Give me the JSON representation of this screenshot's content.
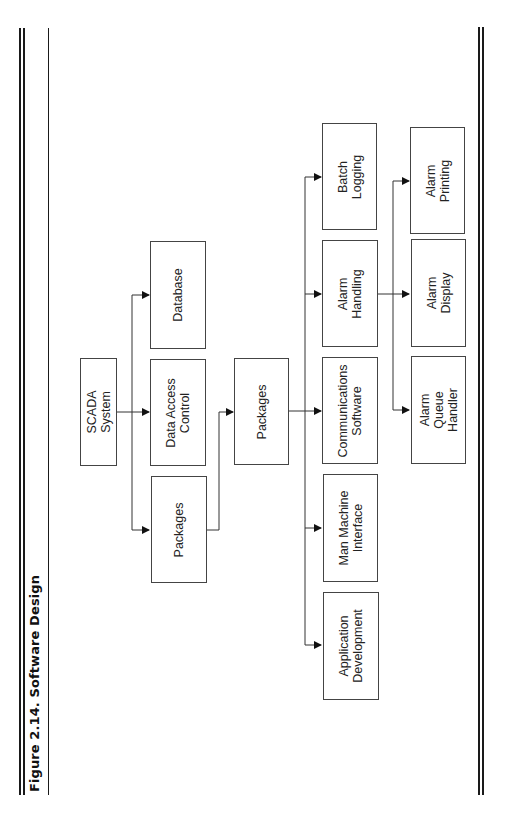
{
  "figure": {
    "title": "Figure 2.14. Software Design",
    "orientation": "rotated-90-ccw"
  },
  "diagram": {
    "type": "hierarchy",
    "nodes": {
      "scada_system": {
        "label": "SCADA\nSystem",
        "level": 1
      },
      "database": {
        "label": "Database",
        "level": 2
      },
      "data_access_control": {
        "label": "Data Access\nControl",
        "level": 2
      },
      "packages_l2": {
        "label": "Packages",
        "level": 2
      },
      "packages_l3": {
        "label": "Packages",
        "level": 3
      },
      "batch_logging": {
        "label": "Batch\nLogging",
        "level": 4
      },
      "alarm_handling": {
        "label": "Alarm\nHandling",
        "level": 4
      },
      "communications_software": {
        "label": "Communications\nSoftware",
        "level": 4
      },
      "man_machine_interface": {
        "label": "Man Machine\nInterface",
        "level": 4
      },
      "application_development": {
        "label": "Application\nDevelopment",
        "level": 4
      },
      "alarm_printing": {
        "label": "Alarm\nPrinting",
        "level": 5
      },
      "alarm_display": {
        "label": "Alarm\nDisplay",
        "level": 5
      },
      "alarm_queue_handler": {
        "label": "Alarm\nQueue\nHandler",
        "level": 5
      }
    },
    "edges": [
      {
        "from": "scada_system",
        "to": "database"
      },
      {
        "from": "scada_system",
        "to": "data_access_control"
      },
      {
        "from": "scada_system",
        "to": "packages_l2"
      },
      {
        "from": "packages_l2",
        "to": "packages_l3"
      },
      {
        "from": "packages_l3",
        "to": "batch_logging"
      },
      {
        "from": "packages_l3",
        "to": "alarm_handling"
      },
      {
        "from": "packages_l3",
        "to": "communications_software"
      },
      {
        "from": "packages_l3",
        "to": "man_machine_interface"
      },
      {
        "from": "packages_l3",
        "to": "application_development"
      },
      {
        "from": "alarm_handling",
        "to": "alarm_printing"
      },
      {
        "from": "alarm_handling",
        "to": "alarm_display"
      },
      {
        "from": "alarm_handling",
        "to": "alarm_queue_handler"
      }
    ]
  },
  "colors": {
    "line": "#333333",
    "box_border": "#444444",
    "text": "#222222",
    "background": "#ffffff"
  }
}
